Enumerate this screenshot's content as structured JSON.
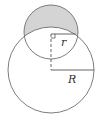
{
  "diagram": {
    "labels": {
      "small_radius": "r",
      "large_radius": "R"
    },
    "colors": {
      "stroke": "#6e6e6e",
      "shade": "#d4d4d4",
      "background": "#ffffff"
    },
    "small_circle": {
      "cx": 51,
      "cy": 32,
      "r": 27
    },
    "large_circle": {
      "cx": 51,
      "cy": 70,
      "r": 43
    }
  }
}
